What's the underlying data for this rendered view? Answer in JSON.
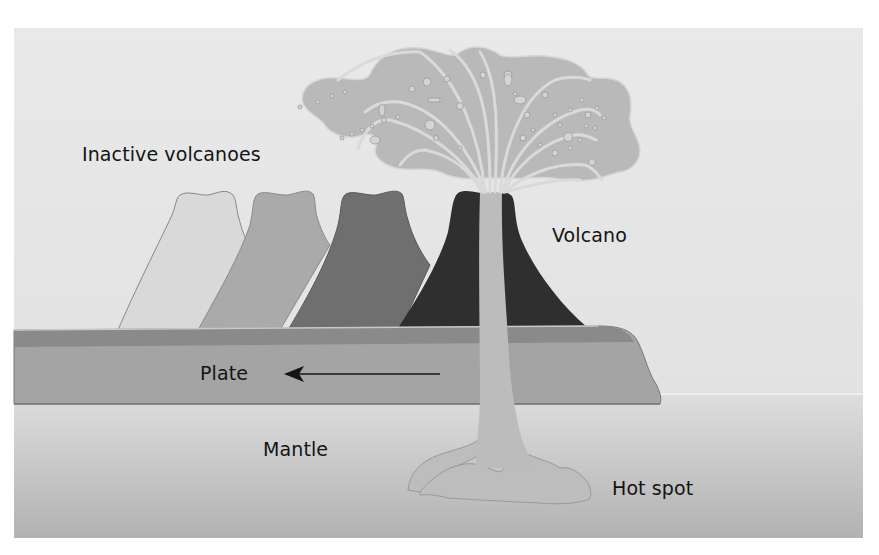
{
  "diagram": {
    "type": "cross-section",
    "labels": {
      "inactive_volcanoes": "Inactive volcanoes",
      "volcano": "Volcano",
      "plate": "Plate",
      "mantle": "Mantle",
      "hot_spot": "Hot spot"
    },
    "arrow": {
      "direction": "left",
      "meaning": "plate motion"
    },
    "colors": {
      "sky": "#e6e6e6",
      "mantle_top": "#dcdcdc",
      "mantle_bottom": "#b4b4b4",
      "plate_top_band": "#8a8a8a",
      "plate_body": "#a3a3a3",
      "inactive_volcano_1": "#d9d9d9",
      "inactive_volcano_2": "#a9a9a9",
      "inactive_volcano_3": "#6f6f6f",
      "active_volcano": "#2e2e2e",
      "magma": "#bdbdbd",
      "eruption_cloud": "#b9b9b9",
      "text": "#141414"
    }
  }
}
